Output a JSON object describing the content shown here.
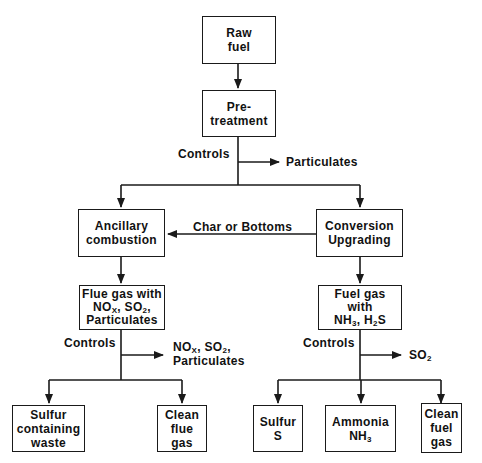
{
  "diagram": {
    "nodes": {
      "raw_fuel": [
        "Raw",
        "fuel"
      ],
      "pretreatment": [
        "Pre-",
        "treatment"
      ],
      "ancillary": [
        "Ancillary",
        "combustion"
      ],
      "conversion": [
        "Conversion",
        "Upgrading"
      ],
      "flue_gas": {
        "line1": "Flue gas with",
        "nox": "NO",
        "nox_sub": "X",
        "sep": ", ",
        "so2": "SO",
        "so2_sub": "2",
        "tail": ",",
        "line3": "Particulates"
      },
      "fuel_gas": {
        "line1": "Fuel gas",
        "line2": "with",
        "nh": "NH",
        "nh_sub": "3",
        "sep": ", H",
        "h_sub": "2",
        "s": "S"
      },
      "sulfur_waste": [
        "Sulfur",
        "containing",
        "waste"
      ],
      "clean_flue": [
        "Clean",
        "flue",
        "gas"
      ],
      "sulfur_s": [
        "Sulfur",
        "S"
      ],
      "ammonia": {
        "line1": "Ammonia",
        "nh": "NH",
        "nh_sub": "3"
      },
      "clean_fuel": [
        "Clean",
        "fuel",
        "gas"
      ]
    },
    "labels": {
      "controls_top": "Controls",
      "particulates_top": "Particulates",
      "char_bottoms": "Char or Bottoms",
      "controls_left": "Controls",
      "left_out": {
        "nox": "NO",
        "nox_sub": "X",
        "sep": ", SO",
        "so2_sub": "2",
        "tail": ",",
        "line2": "Particulates"
      },
      "controls_right": "Controls",
      "right_out": {
        "so": "SO",
        "sub": "2"
      }
    }
  }
}
